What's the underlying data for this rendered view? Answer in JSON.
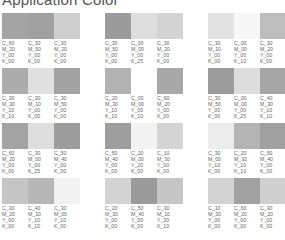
{
  "title": "Application Color",
  "rows": [
    {
      "groups": [
        {
          "swatches": [
            {
              "color": "#a4a4a4",
              "c": "C_60",
              "m": "M_20",
              "y": "Y_00",
              "k": "K_00"
            },
            {
              "color": "#a0a0a0",
              "c": "C_30",
              "m": "M_50",
              "y": "Y_00",
              "k": "K_00"
            },
            {
              "color": "#cfcfcf",
              "c": "C_30",
              "m": "M_20",
              "y": "Y_00",
              "k": "K_00"
            }
          ]
        },
        {
          "swatches": [
            {
              "color": "#9b9b9b",
              "c": "C_30",
              "m": "M_50",
              "y": "Y_00",
              "k": "K_00"
            },
            {
              "color": "#dedede",
              "c": "C_00",
              "m": "M_00",
              "y": "Y_00",
              "k": "K_25"
            },
            {
              "color": "#d3d3d3",
              "c": "C_30",
              "m": "M_20",
              "y": "Y_00",
              "k": "K_00"
            }
          ]
        },
        {
          "swatches": [
            {
              "color": "#e2e2e2",
              "c": "C_30",
              "m": "M_10",
              "y": "Y_00",
              "k": "K_00"
            },
            {
              "color": "#f7f7f7",
              "c": "C_00",
              "m": "M_00",
              "y": "Y_00",
              "k": "K_10"
            },
            {
              "color": "#bdbdbd",
              "c": "C_30",
              "m": "M_20",
              "y": "Y_00",
              "k": "K_00"
            }
          ]
        }
      ]
    },
    {
      "groups": [
        {
          "swatches": [
            {
              "color": "#acacac",
              "c": "C_30",
              "m": "M_30",
              "y": "Y_10",
              "k": "K_10"
            },
            {
              "color": "#e0e0e0",
              "c": "C_30",
              "m": "M_10",
              "y": "Y_00",
              "k": "K_00"
            },
            {
              "color": "#a2a2a2",
              "c": "C_30",
              "m": "M_50",
              "y": "Y_00",
              "k": "K_00"
            }
          ]
        },
        {
          "swatches": [
            {
              "color": "#b2b2b2",
              "c": "C_20",
              "m": "M_30",
              "y": "Y_10",
              "k": "K_10"
            },
            {
              "color": "#ffffff",
              "c": "C_00",
              "m": "M_00",
              "y": "Y_00",
              "k": "K_10"
            },
            {
              "color": "#a8a8a8",
              "c": "C_60",
              "m": "M_20",
              "y": "Y_00",
              "k": "K_00"
            }
          ]
        },
        {
          "swatches": [
            {
              "color": "#9c9c9c",
              "c": "C_30",
              "m": "M_50",
              "y": "Y_00",
              "k": "K_00"
            },
            {
              "color": "#dcdcdc",
              "c": "C_00",
              "m": "M_00",
              "y": "Y_00",
              "k": "K_25"
            },
            {
              "color": "#a6a6a6",
              "c": "C_40",
              "m": "M_30",
              "y": "Y_10",
              "k": "K_10"
            }
          ]
        }
      ]
    },
    {
      "groups": [
        {
          "swatches": [
            {
              "color": "#a3a3a3",
              "c": "C_60",
              "m": "M_20",
              "y": "Y_00",
              "k": "K_00"
            },
            {
              "color": "#dedede",
              "c": "C_30",
              "m": "M_00",
              "y": "Y_00",
              "k": "K_25"
            },
            {
              "color": "#9d9d9d",
              "c": "C_50",
              "m": "M_40",
              "y": "Y_00",
              "k": "K_00"
            }
          ]
        },
        {
          "swatches": [
            {
              "color": "#9e9e9e",
              "c": "C_50",
              "m": "M_40",
              "y": "Y_00",
              "k": "K_00"
            },
            {
              "color": "#f2f2f2",
              "c": "C_20",
              "m": "M_00",
              "y": "Y_20",
              "k": "K_00"
            },
            {
              "color": "#d4d4d4",
              "c": "C_10",
              "m": "M_30",
              "y": "Y_00",
              "k": "K_00"
            }
          ]
        },
        {
          "swatches": [
            {
              "color": "#ececec",
              "c": "C_30",
              "m": "M_00",
              "y": "Y_10",
              "k": "K_00"
            },
            {
              "color": "#b4b4b4",
              "c": "C_20",
              "m": "M_30",
              "y": "Y_10",
              "k": "K_10"
            },
            {
              "color": "#a0a0a0",
              "c": "C_50",
              "m": "M_40",
              "y": "Y_00",
              "k": "K_00"
            }
          ]
        }
      ]
    },
    {
      "groups": [
        {
          "swatches": [
            {
              "color": "#c5c5c5",
              "c": "C_30",
              "m": "M_20",
              "y": "Y_00",
              "k": "K_00"
            },
            {
              "color": "#b7b7b7",
              "c": "C_40",
              "m": "M_10",
              "y": "Y_10",
              "k": "K_10"
            },
            {
              "color": "#f2f2f2",
              "c": "C_30",
              "m": "M_00",
              "y": "Y_10",
              "k": "K_00"
            }
          ]
        },
        {
          "swatches": [
            {
              "color": "#d3d3d3",
              "c": "C_20",
              "m": "M_30",
              "y": "Y_00",
              "k": "K_00"
            },
            {
              "color": "#9a9a9a",
              "c": "C_50",
              "m": "M_40",
              "y": "Y_00",
              "k": "K_00"
            },
            {
              "color": "#c6c6c6",
              "c": "C_30",
              "m": "M_10",
              "y": "Y_30",
              "k": "K_10"
            }
          ]
        },
        {
          "swatches": [
            {
              "color": "#d3d3d3",
              "c": "C_10",
              "m": "M_30",
              "y": "Y_00",
              "k": "K_00"
            },
            {
              "color": "#a1a1a1",
              "c": "C_60",
              "m": "M_20",
              "y": "Y_00",
              "k": "K_00"
            },
            {
              "color": "#cfcfcf",
              "c": "C_30",
              "m": "M_20",
              "y": "Y_00",
              "k": "K_00"
            }
          ]
        }
      ]
    }
  ]
}
